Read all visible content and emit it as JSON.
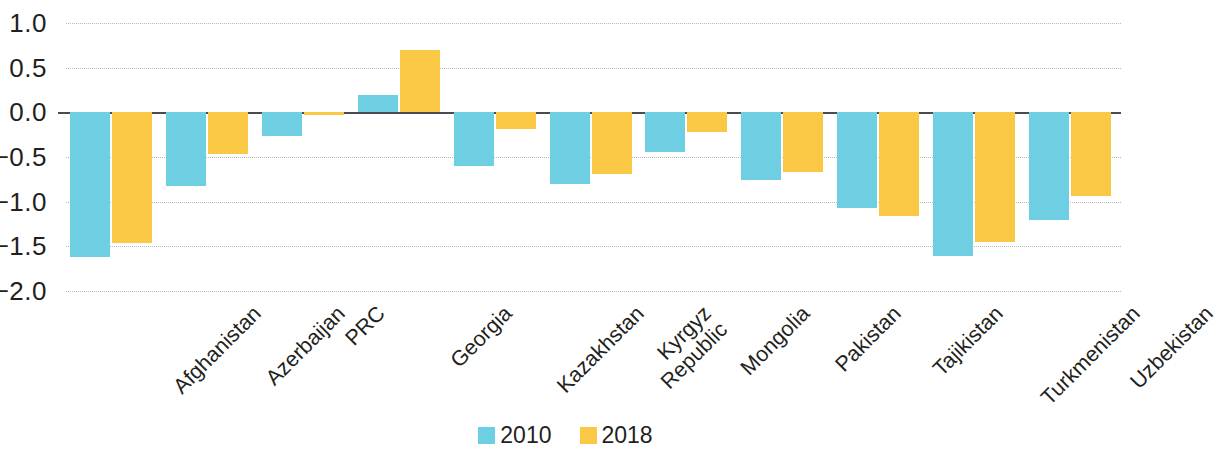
{
  "chart_data": {
    "type": "bar",
    "title": "",
    "subtitle": "",
    "xlabel": "",
    "ylabel": "",
    "ylim": [
      -2.0,
      1.0
    ],
    "ytick_values": [
      1.0,
      0.5,
      0.0,
      -0.5,
      -1.0,
      -1.5,
      -2.0
    ],
    "ytick_labels": [
      "1.0",
      "0.5",
      "0.0",
      "−0.5",
      "−1.0",
      "−1.5",
      "−2.0"
    ],
    "grid": true,
    "legend_position": "bottom-center",
    "categories": [
      "Afghanistan",
      "Azerbaijan",
      "PRC",
      "Georgia",
      "Kazakhstan",
      "Kyrgyz\nRepublic",
      "Mongolia",
      "Pakistan",
      "Tajikistan",
      "Turkmenistan",
      "Uzbekistan"
    ],
    "series": [
      {
        "name": "2010",
        "color": "#6FCFE2",
        "values": [
          -1.62,
          -0.83,
          -0.27,
          0.19,
          -0.6,
          -0.8,
          -0.44,
          -0.76,
          -1.07,
          -1.61,
          -1.2
        ]
      },
      {
        "name": "2018",
        "color": "#FBC846",
        "values": [
          -1.46,
          -0.47,
          -0.03,
          0.7,
          -0.19,
          -0.69,
          -0.22,
          -0.67,
          -1.16,
          -1.45,
          -0.94
        ]
      }
    ]
  },
  "legend": {
    "items": [
      {
        "label": "2010",
        "color": "#6FCFE2"
      },
      {
        "label": "2018",
        "color": "#FBC846"
      }
    ]
  }
}
